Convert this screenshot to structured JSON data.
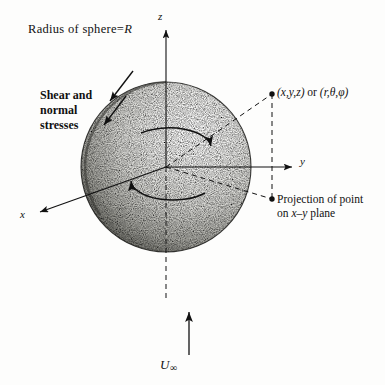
{
  "figure": {
    "title_note": "Radius of sphere=R",
    "radius_symbol": "R",
    "background_color": "#fdfdfc",
    "ink_color": "#111111"
  },
  "labels": {
    "radius": {
      "prefix": "Radius of sphere=",
      "symbol": "R"
    },
    "shear": {
      "line1": "Shear and",
      "line2": "normal",
      "line3": "stresses"
    },
    "coords": {
      "cartesian": "(x,y,z)",
      "conjunction": "or",
      "spherical": "(r,θ,φ)"
    },
    "projection": {
      "line1": "Projection of point",
      "line2_prefix": "on ",
      "line2_axes": "x–y",
      "line2_suffix": " plane"
    },
    "freestream": {
      "symbol": "U",
      "subscript": "∞"
    }
  },
  "axes": {
    "z": {
      "label": "z",
      "direction": "up"
    },
    "y": {
      "label": "y",
      "direction": "right"
    },
    "x": {
      "label": "x",
      "direction": "down-left"
    }
  },
  "sphere": {
    "center_x": 166,
    "center_y": 167,
    "radius": 85,
    "shading": "stipple",
    "light_from": "upper-right"
  },
  "annotations": {
    "stress_arrows": 2,
    "circulation_arrows": 2,
    "point_markers": 2,
    "dashed_guides": 3,
    "flow_arrow": "upward"
  }
}
